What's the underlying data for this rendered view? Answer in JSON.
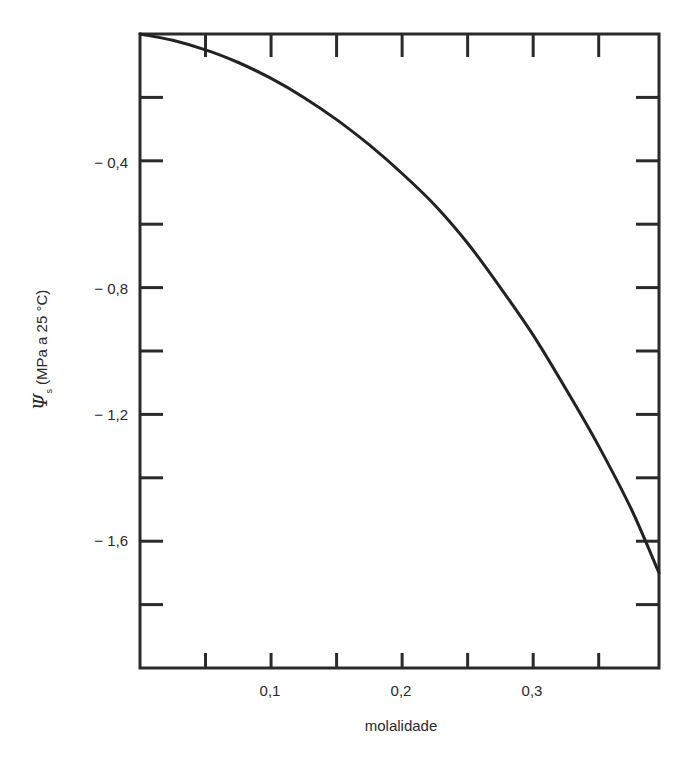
{
  "chart_data": {
    "type": "line",
    "title": "",
    "xlabel": "molalidade",
    "ylabel": "Ψs (MPa a 25 °C)",
    "ylabel_parts": {
      "symbol": "Ψ",
      "subscript": "s",
      "rest": "(MPa a 25 °C)"
    },
    "xlim": [
      0,
      0.396
    ],
    "ylim": [
      -2.0,
      0
    ],
    "x_ticks_major": [
      0.1,
      0.2,
      0.3
    ],
    "x_tick_labels": [
      "0,1",
      "0,2",
      "0,3"
    ],
    "x_ticks_minor": [
      0.05,
      0.1,
      0.15,
      0.2,
      0.25,
      0.3,
      0.35
    ],
    "y_ticks_major": [
      -0.4,
      -0.8,
      -1.2,
      -1.6
    ],
    "y_tick_labels": [
      "− 0,4",
      "− 0,8",
      "− 1,2",
      "− 1,6"
    ],
    "y_ticks_minor": [
      -0.2,
      -0.4,
      -0.6,
      -0.8,
      -1.0,
      -1.2,
      -1.4,
      -1.6,
      -1.8
    ],
    "grid": false,
    "legend": null,
    "frame": "box with inward ticks on all four sides",
    "series": [
      {
        "name": "Ψs",
        "color": "#222222",
        "x": [
          0,
          0.025,
          0.05,
          0.075,
          0.1,
          0.125,
          0.15,
          0.175,
          0.2,
          0.225,
          0.25,
          0.275,
          0.3,
          0.325,
          0.35,
          0.375,
          0.396
        ],
        "y": [
          0,
          -0.02,
          -0.05,
          -0.09,
          -0.14,
          -0.2,
          -0.27,
          -0.35,
          -0.44,
          -0.54,
          -0.66,
          -0.8,
          -0.95,
          -1.12,
          -1.3,
          -1.5,
          -1.7
        ]
      }
    ]
  },
  "labels": {
    "x_axis_title": "molalidade",
    "y_axis_symbol": "Ψ",
    "y_axis_subscript": "s",
    "y_axis_rest": " (MPa a 25 °C)",
    "x_tick_0": "0,1",
    "x_tick_1": "0,2",
    "x_tick_2": "0,3",
    "y_tick_0": "− 0,4",
    "y_tick_1": "− 0,8",
    "y_tick_2": "− 1,2",
    "y_tick_3": "− 1,6"
  },
  "style": {
    "line_color": "#222222",
    "frame_color": "#2a2a2a",
    "background": "#ffffff"
  }
}
